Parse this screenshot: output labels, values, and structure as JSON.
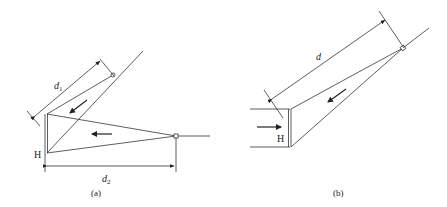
{
  "figure": {
    "panels": [
      {
        "id": "a",
        "caption": "(a)",
        "wall_label": "H",
        "dimensions": [
          {
            "symbol": "d",
            "subscript": "1"
          },
          {
            "symbol": "d",
            "subscript": "2"
          }
        ],
        "arrows": [
          "flow-toward-wall-diagonal",
          "flow-toward-wall-horizontal"
        ]
      },
      {
        "id": "b",
        "caption": "(b)",
        "wall_label": "H",
        "dimensions": [
          {
            "symbol": "d",
            "subscript": ""
          }
        ],
        "arrows": [
          "flow-into-wall-channel",
          "flow-toward-wall-diagonal"
        ]
      }
    ],
    "colors": {
      "line": "#333333",
      "background": "#ffffff"
    }
  }
}
